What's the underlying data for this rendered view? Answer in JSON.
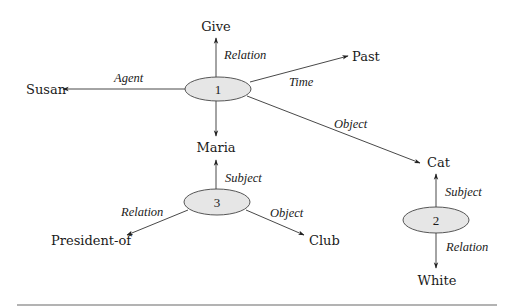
{
  "diagram": {
    "type": "semantic-network",
    "colors": {
      "node_fill": "#e6e6e6",
      "node_stroke": "#444444",
      "edge": "#333333",
      "text": "#1a1a1a",
      "rule": "#9a9a9a"
    },
    "nodes": [
      {
        "id": "1",
        "label": "1",
        "cx": 218,
        "cy": 89,
        "rx": 33,
        "ry": 12
      },
      {
        "id": "3",
        "label": "3",
        "cx": 217,
        "cy": 202,
        "rx": 33,
        "ry": 13
      },
      {
        "id": "2",
        "label": "2",
        "cx": 436,
        "cy": 220,
        "rx": 33,
        "ry": 13
      }
    ],
    "terms": [
      {
        "id": "give",
        "label": "Give",
        "x": 216,
        "y": 31,
        "anchor": "middle"
      },
      {
        "id": "past",
        "label": "Past",
        "x": 352,
        "y": 61,
        "anchor": "start"
      },
      {
        "id": "susan",
        "label": "Susan",
        "x": 26,
        "y": 94,
        "anchor": "start"
      },
      {
        "id": "maria",
        "label": "Maria",
        "x": 216,
        "y": 152,
        "anchor": "middle"
      },
      {
        "id": "cat",
        "label": "Cat",
        "x": 427,
        "y": 167,
        "anchor": "start"
      },
      {
        "id": "president-of",
        "label": "President-of",
        "x": 51,
        "y": 245,
        "anchor": "start"
      },
      {
        "id": "club",
        "label": "Club",
        "x": 309,
        "y": 245,
        "anchor": "start"
      },
      {
        "id": "white",
        "label": "White",
        "x": 437,
        "y": 285,
        "anchor": "middle"
      }
    ],
    "edges": [
      {
        "from": "1",
        "to": "give",
        "label": "Relation",
        "x1": 216,
        "y1": 77,
        "x2": 216,
        "y2": 38,
        "lx": 224,
        "ly": 59,
        "anchor": "start"
      },
      {
        "from": "1",
        "to": "past",
        "label": "Time",
        "x1": 250,
        "y1": 82,
        "x2": 348,
        "y2": 56,
        "lx": 289,
        "ly": 86,
        "anchor": "start"
      },
      {
        "from": "1",
        "to": "susan",
        "label": "Agent",
        "x1": 185,
        "y1": 89,
        "x2": 63,
        "y2": 89,
        "lx": 114,
        "ly": 82,
        "anchor": "start"
      },
      {
        "from": "1",
        "to": "maria",
        "label": "",
        "x1": 216,
        "y1": 101,
        "x2": 216,
        "y2": 136,
        "lx": 0,
        "ly": 0,
        "anchor": "start"
      },
      {
        "from": "1",
        "to": "cat",
        "label": "Object",
        "x1": 247,
        "y1": 96,
        "x2": 420,
        "y2": 163,
        "lx": 334,
        "ly": 128,
        "anchor": "start"
      },
      {
        "from": "3",
        "to": "maria",
        "label": "Subject",
        "x1": 216,
        "y1": 189,
        "x2": 216,
        "y2": 160,
        "lx": 225,
        "ly": 182,
        "anchor": "start"
      },
      {
        "from": "3",
        "to": "president-of",
        "label": "Relation",
        "x1": 188,
        "y1": 210,
        "x2": 127,
        "y2": 235,
        "lx": 121,
        "ly": 216,
        "anchor": "start"
      },
      {
        "from": "3",
        "to": "club",
        "label": "Object",
        "x1": 246,
        "y1": 210,
        "x2": 304,
        "y2": 235,
        "lx": 270,
        "ly": 217,
        "anchor": "start"
      },
      {
        "from": "2",
        "to": "cat",
        "label": "Subject",
        "x1": 436,
        "y1": 207,
        "x2": 436,
        "y2": 174,
        "lx": 445,
        "ly": 196,
        "anchor": "start"
      },
      {
        "from": "2",
        "to": "white",
        "label": "Relation",
        "x1": 436,
        "y1": 233,
        "x2": 436,
        "y2": 268,
        "lx": 446,
        "ly": 251,
        "anchor": "start"
      }
    ],
    "rule": {
      "x1": 17,
      "y1": 305,
      "x2": 497,
      "y2": 305
    }
  }
}
